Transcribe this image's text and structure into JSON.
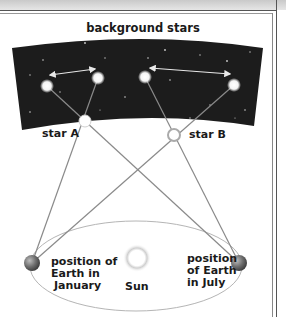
{
  "diagram": {
    "title": "background stars",
    "labels": {
      "star_a": "star A",
      "star_b": "star B",
      "earth_january": [
        "position of",
        "Earth in",
        "January"
      ],
      "earth_july": [
        "position",
        "of Earth",
        "in July"
      ],
      "sun": "Sun"
    },
    "nodes": [
      {
        "id": "bg-star-1",
        "type": "background-star",
        "x": 47,
        "y": 86
      },
      {
        "id": "bg-star-2",
        "type": "background-star",
        "x": 98,
        "y": 78
      },
      {
        "id": "bg-star-3",
        "type": "background-star",
        "x": 145,
        "y": 77
      },
      {
        "id": "bg-star-4",
        "type": "background-star",
        "x": 234,
        "y": 85
      },
      {
        "id": "star-a",
        "type": "near-star",
        "label": "star A",
        "x": 85,
        "y": 121
      },
      {
        "id": "star-b",
        "type": "near-star",
        "label": "star B",
        "x": 174,
        "y": 135
      },
      {
        "id": "earth-january",
        "type": "earth",
        "x": 32,
        "y": 263
      },
      {
        "id": "earth-july",
        "type": "earth",
        "x": 239,
        "y": 263
      },
      {
        "id": "sun",
        "type": "sun",
        "x": 137,
        "y": 258
      }
    ],
    "sight_lines": [
      {
        "from": "earth-january",
        "through": "star-a",
        "to": "bg-star-2"
      },
      {
        "from": "earth-july",
        "through": "star-a",
        "to": "bg-star-1"
      },
      {
        "from": "earth-january",
        "through": "star-b",
        "to": "bg-star-4"
      },
      {
        "from": "earth-july",
        "through": "star-b",
        "to": "bg-star-3"
      }
    ],
    "shift_arrows": [
      {
        "from": "bg-star-1",
        "to": "bg-star-2",
        "style": "double-headed"
      },
      {
        "from": "bg-star-3",
        "to": "bg-star-4",
        "style": "double-headed"
      }
    ],
    "colors": {
      "sky": "#1c1c1c",
      "line": "#8a8a8a",
      "orbit": "#b5b5b5",
      "earth": "#6e6e6e",
      "text": "#1a1a1a"
    }
  }
}
